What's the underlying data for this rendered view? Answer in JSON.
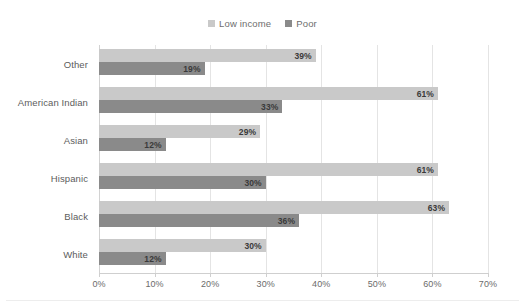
{
  "chart_data": {
    "type": "bar",
    "orientation": "horizontal",
    "title": "",
    "subtitle": "",
    "xlabel": "",
    "ylabel": "",
    "xlim": [
      0,
      70
    ],
    "xtick_step": 10,
    "xtick_labels": [
      "0%",
      "10%",
      "20%",
      "30%",
      "40%",
      "50%",
      "60%",
      "70%"
    ],
    "xtick_values": [
      0,
      10,
      20,
      30,
      40,
      50,
      60,
      70
    ],
    "grid": true,
    "grid_axis": "x",
    "legend_position": "top-center",
    "categories": [
      "Other",
      "American Indian",
      "Asian",
      "Hispanic",
      "Black",
      "White"
    ],
    "series": [
      {
        "name": "Low income",
        "color": "#c9c9c9",
        "values": [
          39,
          61,
          29,
          61,
          63,
          30
        ],
        "labels": [
          "39%",
          "61%",
          "29%",
          "61%",
          "63%",
          "30%"
        ]
      },
      {
        "name": "Poor",
        "color": "#8a8a8a",
        "values": [
          19,
          33,
          12,
          30,
          36,
          12
        ],
        "labels": [
          "19%",
          "33%",
          "12%",
          "30%",
          "36%",
          "12%"
        ]
      }
    ]
  },
  "legend": {
    "entries": [
      {
        "label": "Low income",
        "color": "#c9c9c9"
      },
      {
        "label": "Poor",
        "color": "#8a8a8a"
      }
    ]
  },
  "colors": {
    "low_income": "#c9c9c9",
    "poor": "#8a8a8a",
    "gridline": "#e4e4e4",
    "axis": "#cfcfcf",
    "tick_text": "#6b6b6b",
    "category_text": "#5c5c5c",
    "value_text": "#3a3a3a",
    "background": "#ffffff"
  }
}
